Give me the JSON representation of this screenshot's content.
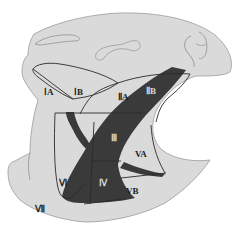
{
  "diagram": {
    "colors": {
      "background": "#ffffff",
      "skin": "#dadada",
      "outline": "#9a9a9a",
      "region_line": "#2a2a2a",
      "muscle": "#3a3a3a",
      "label_dark": "#1e1e1e",
      "label_light": "#d8d8d8"
    },
    "labels": {
      "IA": "ⅠA",
      "IB": "ⅠB",
      "IIA": "ⅡA",
      "IIB": "ⅡB",
      "III": "Ⅲ",
      "IV": "Ⅳ",
      "VA": "VA",
      "VB": "VB",
      "VI": "Ⅵ",
      "VII": "Ⅶ"
    }
  }
}
